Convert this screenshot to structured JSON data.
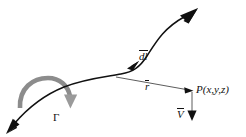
{
  "figure": {
    "type": "vector-diagram",
    "width": 246,
    "height": 137,
    "background_color": "#ffffff",
    "curve_color": "#111111",
    "circulation_color": "#8c8c8c",
    "vector_color": "#4a4a4a"
  },
  "labels": {
    "dl": {
      "text": "dl",
      "has_vector_overline": true,
      "name": "differential-length-element"
    },
    "r": {
      "text": "r",
      "has_vector_overline": true,
      "name": "position-vector"
    },
    "point": {
      "text": "P(x,y,z)",
      "name": "field-point"
    },
    "velocity": {
      "text": "V",
      "has_vector_overline": true,
      "name": "induced-velocity-vector"
    },
    "circulation": {
      "text": "Γ",
      "name": "circulation-strength"
    }
  },
  "elements": {
    "filament_curve": "vortex-filament-curve",
    "filament_arrow_start": "filament-arrowhead-lower-left",
    "filament_arrow_end": "filament-arrowhead-upper-right",
    "dl_arrow": "dl-direction-arrowhead",
    "r_vector": "r-vector-line",
    "v_vector": "v-vector-line",
    "circulation_arrow": "circulation-curved-arrow"
  }
}
